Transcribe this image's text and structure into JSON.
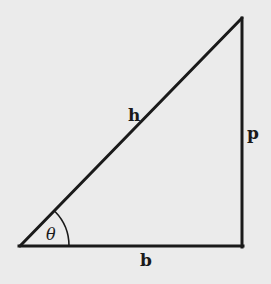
{
  "diagram": {
    "type": "right-triangle",
    "vertices": {
      "bottom_left": [
        20,
        246
      ],
      "bottom_right": [
        242,
        246
      ],
      "top_right": [
        242,
        18
      ]
    },
    "labels": {
      "hypotenuse": "h",
      "perpendicular": "p",
      "base": "b",
      "angle": "θ"
    },
    "colors": {
      "background": "#ebebeb",
      "stroke": "#1a1a1a"
    }
  }
}
